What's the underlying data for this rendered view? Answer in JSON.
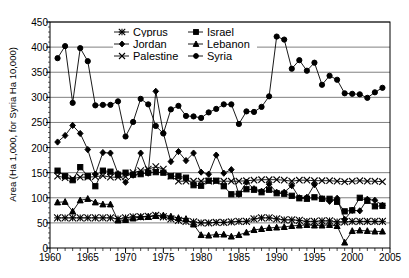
{
  "chart_data": {
    "type": "line",
    "title": "",
    "xlabel": "",
    "ylabel": "Area (Ha 1,000, for Syria Ha 10,000)",
    "xlim": [
      1960,
      2005
    ],
    "ylim": [
      0,
      450
    ],
    "xticks": [
      1960,
      1965,
      1970,
      1975,
      1980,
      1985,
      1990,
      1995,
      2000,
      2005
    ],
    "yticks": [
      0,
      50,
      100,
      150,
      200,
      250,
      300,
      350,
      400,
      450
    ],
    "grid": "horizontal",
    "minor_xticks": 1,
    "legend_position": "top-center",
    "x": [
      1961,
      1962,
      1963,
      1964,
      1965,
      1966,
      1967,
      1968,
      1969,
      1970,
      1971,
      1972,
      1973,
      1974,
      1975,
      1976,
      1977,
      1978,
      1979,
      1980,
      1981,
      1982,
      1983,
      1984,
      1985,
      1986,
      1987,
      1988,
      1989,
      1990,
      1991,
      1992,
      1993,
      1994,
      1995,
      1996,
      1997,
      1998,
      1999,
      2000,
      2001,
      2002,
      2003,
      2004
    ],
    "series": [
      {
        "name": "Syria",
        "marker": "circle",
        "values": [
          378,
          402,
          289,
          398,
          372,
          284,
          285,
          285,
          292,
          222,
          251,
          297,
          286,
          243,
          228,
          276,
          283,
          263,
          262,
          259,
          270,
          277,
          286,
          286,
          247,
          272,
          271,
          281,
          302,
          421,
          415,
          357,
          374,
          353,
          369,
          325,
          343,
          335,
          308,
          307,
          306,
          299,
          310,
          319
        ]
      },
      {
        "name": "Jordan",
        "marker": "diamond",
        "values": [
          211,
          224,
          244,
          228,
          196,
          147,
          190,
          189,
          148,
          131,
          145,
          189,
          149,
          312,
          229,
          172,
          192,
          174,
          189,
          151,
          147,
          185,
          149,
          156,
          107,
          131,
          118,
          113,
          127,
          111,
          111,
          124,
          100,
          101,
          126,
          98,
          93,
          99,
          57,
          75,
          74,
          97,
          95,
          85
        ]
      },
      {
        "name": "Israel",
        "marker": "square",
        "values": [
          154,
          143,
          135,
          161,
          143,
          123,
          154,
          152,
          146,
          150,
          146,
          147,
          150,
          151,
          150,
          143,
          143,
          140,
          125,
          124,
          134,
          134,
          123,
          107,
          108,
          117,
          116,
          111,
          116,
          109,
          108,
          104,
          99,
          98,
          101,
          98,
          98,
          92,
          73,
          75,
          100,
          94,
          83,
          84
        ]
      },
      {
        "name": "Palestine",
        "marker": "x",
        "values": [
          143,
          140,
          138,
          141,
          141,
          142,
          144,
          141,
          141,
          142,
          150,
          154,
          157,
          162,
          157,
          143,
          133,
          133,
          133,
          133,
          133,
          133,
          133,
          133,
          133,
          134,
          135,
          136,
          136,
          136,
          135,
          133,
          135,
          135,
          134,
          134,
          134,
          133,
          132,
          133,
          134,
          133,
          133,
          132
        ]
      },
      {
        "name": "Cyprus",
        "marker": "star",
        "values": [
          60,
          60,
          60,
          60,
          60,
          60,
          60,
          60,
          58,
          60,
          62,
          62,
          63,
          65,
          62,
          58,
          55,
          53,
          52,
          50,
          50,
          51,
          51,
          52,
          53,
          53,
          58,
          60,
          60,
          58,
          56,
          56,
          55,
          53,
          53,
          54,
          54,
          52,
          52,
          53,
          53,
          53,
          53,
          53
        ]
      },
      {
        "name": "Lebanon",
        "marker": "triangle",
        "values": [
          91,
          92,
          73,
          95,
          98,
          91,
          87,
          87,
          55,
          56,
          59,
          62,
          62,
          64,
          65,
          63,
          60,
          58,
          47,
          26,
          25,
          27,
          27,
          23,
          26,
          31,
          36,
          38,
          40,
          41,
          42,
          44,
          45,
          46,
          45,
          45,
          46,
          44,
          11,
          34,
          35,
          34,
          33,
          33
        ]
      }
    ],
    "legend_entries": [
      "Cyprus",
      "Israel",
      "Jordan",
      "Lebanon",
      "Palestine",
      "Syria"
    ]
  }
}
